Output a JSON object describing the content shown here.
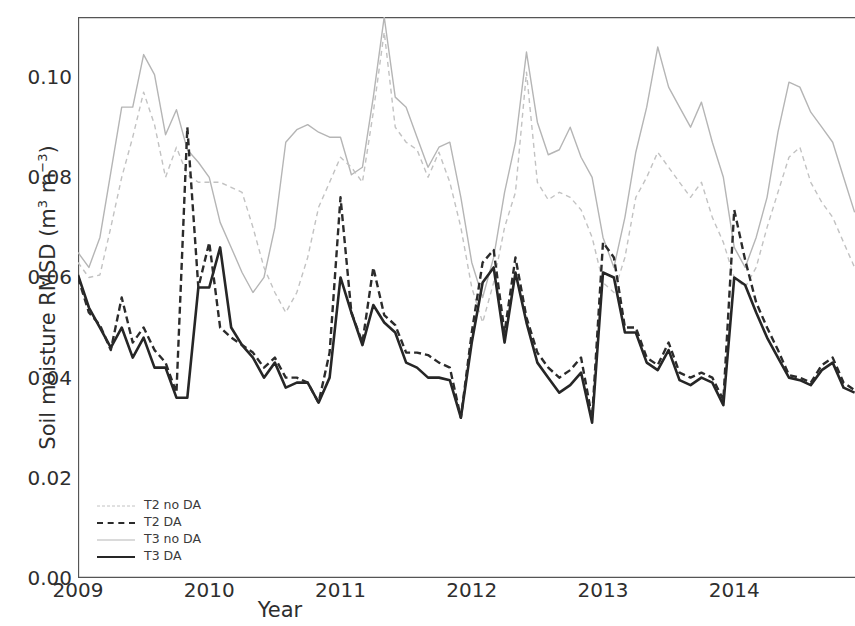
{
  "chart_data": {
    "type": "line",
    "title": "",
    "xlabel": "Year",
    "ylabel": "Soil moisture RMSD (m3 m-3)",
    "ylabel_parts": {
      "main": "Soil moisture RMSD (m",
      "sup1": "3",
      "mid": " m",
      "sup2": "−3",
      "end": ")"
    },
    "grid": false,
    "legend_position": "lower left",
    "xlim": [
      2009.0,
      2014.92
    ],
    "ylim": [
      0.0,
      0.112
    ],
    "xticks": [
      2009,
      2010,
      2011,
      2012,
      2013,
      2014
    ],
    "xticklabels": [
      "2009",
      "2010",
      "2011",
      "2012",
      "2013",
      "2014"
    ],
    "yticks": [
      0.0,
      0.02,
      0.04,
      0.06,
      0.08,
      0.1
    ],
    "yticklabels": [
      "0.00",
      "0.02",
      "0.04",
      "0.06",
      "0.08",
      "0.10"
    ],
    "x": [
      2009.0,
      2009.083,
      2009.167,
      2009.25,
      2009.333,
      2009.417,
      2009.5,
      2009.583,
      2009.667,
      2009.75,
      2009.833,
      2009.917,
      2010.0,
      2010.083,
      2010.167,
      2010.25,
      2010.333,
      2010.417,
      2010.5,
      2010.583,
      2010.667,
      2010.75,
      2010.833,
      2010.917,
      2011.0,
      2011.083,
      2011.167,
      2011.25,
      2011.333,
      2011.417,
      2011.5,
      2011.583,
      2011.667,
      2011.75,
      2011.833,
      2011.917,
      2012.0,
      2012.083,
      2012.167,
      2012.25,
      2012.333,
      2012.417,
      2012.5,
      2012.583,
      2012.667,
      2012.75,
      2012.833,
      2012.917,
      2013.0,
      2013.083,
      2013.167,
      2013.25,
      2013.333,
      2013.417,
      2013.5,
      2013.583,
      2013.667,
      2013.75,
      2013.833,
      2013.917,
      2014.0,
      2014.083,
      2014.167,
      2014.25,
      2014.333,
      2014.417,
      2014.5,
      2014.583,
      2014.667,
      2014.75,
      2014.833,
      2014.917
    ],
    "series": [
      {
        "name": "T2 no DA",
        "color": "#c2c2c2",
        "style": "dashed",
        "width": 1.4,
        "values": [
          0.063,
          0.06,
          0.0605,
          0.07,
          0.08,
          0.088,
          0.097,
          0.0905,
          0.08,
          0.086,
          0.0805,
          0.079,
          0.079,
          0.079,
          0.078,
          0.077,
          0.07,
          0.062,
          0.057,
          0.053,
          0.057,
          0.064,
          0.074,
          0.079,
          0.084,
          0.082,
          0.079,
          0.093,
          0.109,
          0.09,
          0.087,
          0.0855,
          0.08,
          0.085,
          0.079,
          0.07,
          0.058,
          0.051,
          0.059,
          0.07,
          0.077,
          0.101,
          0.079,
          0.0755,
          0.077,
          0.076,
          0.0735,
          0.068,
          0.059,
          0.057,
          0.064,
          0.076,
          0.08,
          0.085,
          0.082,
          0.079,
          0.076,
          0.079,
          0.072,
          0.067,
          0.06,
          0.058,
          0.062,
          0.07,
          0.077,
          0.084,
          0.086,
          0.079,
          0.075,
          0.072,
          0.067,
          0.062
        ]
      },
      {
        "name": "T2 DA",
        "color": "#2b2b2b",
        "style": "dashed",
        "width": 2.4,
        "values": [
          0.06,
          0.053,
          0.0505,
          0.0455,
          0.056,
          0.047,
          0.05,
          0.0455,
          0.043,
          0.037,
          0.09,
          0.058,
          0.067,
          0.05,
          0.048,
          0.0465,
          0.045,
          0.042,
          0.044,
          0.04,
          0.04,
          0.039,
          0.035,
          0.045,
          0.076,
          0.053,
          0.047,
          0.062,
          0.0525,
          0.0505,
          0.045,
          0.045,
          0.0445,
          0.043,
          0.042,
          0.032,
          0.049,
          0.063,
          0.0655,
          0.049,
          0.064,
          0.052,
          0.045,
          0.042,
          0.04,
          0.0415,
          0.044,
          0.032,
          0.067,
          0.064,
          0.05,
          0.05,
          0.044,
          0.0425,
          0.047,
          0.041,
          0.04,
          0.041,
          0.04,
          0.0355,
          0.0735,
          0.0635,
          0.055,
          0.05,
          0.0455,
          0.0405,
          0.04,
          0.039,
          0.0425,
          0.044,
          0.039,
          0.0375
        ]
      },
      {
        "name": "T3 no DA",
        "color": "#b5b5b5",
        "style": "solid",
        "width": 1.4,
        "values": [
          0.065,
          0.062,
          0.068,
          0.081,
          0.094,
          0.094,
          0.1045,
          0.1005,
          0.0885,
          0.0935,
          0.0855,
          0.083,
          0.08,
          0.071,
          0.066,
          0.061,
          0.057,
          0.06,
          0.07,
          0.087,
          0.0895,
          0.0905,
          0.089,
          0.088,
          0.088,
          0.0805,
          0.082,
          0.096,
          0.112,
          0.096,
          0.094,
          0.088,
          0.082,
          0.086,
          0.087,
          0.076,
          0.063,
          0.056,
          0.064,
          0.077,
          0.087,
          0.105,
          0.091,
          0.0845,
          0.0855,
          0.09,
          0.084,
          0.08,
          0.068,
          0.062,
          0.072,
          0.085,
          0.094,
          0.106,
          0.098,
          0.094,
          0.09,
          0.095,
          0.087,
          0.08,
          0.066,
          0.062,
          0.068,
          0.076,
          0.089,
          0.099,
          0.098,
          0.093,
          0.09,
          0.087,
          0.08,
          0.073
        ]
      },
      {
        "name": "T3 DA",
        "color": "#262626",
        "style": "solid",
        "width": 2.6,
        "values": [
          0.0605,
          0.054,
          0.05,
          0.046,
          0.05,
          0.044,
          0.048,
          0.042,
          0.042,
          0.036,
          0.036,
          0.058,
          0.058,
          0.066,
          0.05,
          0.0465,
          0.044,
          0.04,
          0.043,
          0.038,
          0.039,
          0.039,
          0.035,
          0.04,
          0.06,
          0.053,
          0.0465,
          0.0545,
          0.051,
          0.049,
          0.043,
          0.042,
          0.04,
          0.04,
          0.0395,
          0.032,
          0.047,
          0.059,
          0.062,
          0.047,
          0.061,
          0.051,
          0.043,
          0.04,
          0.037,
          0.0385,
          0.041,
          0.031,
          0.061,
          0.06,
          0.049,
          0.049,
          0.043,
          0.0415,
          0.0455,
          0.0395,
          0.0385,
          0.04,
          0.039,
          0.0345,
          0.06,
          0.0585,
          0.053,
          0.048,
          0.044,
          0.04,
          0.0395,
          0.0385,
          0.0415,
          0.043,
          0.038,
          0.037
        ]
      }
    ]
  },
  "legend": {
    "items": [
      {
        "label": "T2 no DA"
      },
      {
        "label": "T2 DA"
      },
      {
        "label": "T3 no DA"
      },
      {
        "label": "T3 DA"
      }
    ]
  },
  "axes": {
    "frame_color": "#555555"
  }
}
